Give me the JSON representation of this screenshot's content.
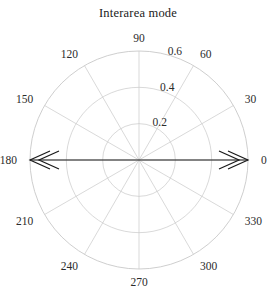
{
  "figure": {
    "title": "Interarea mode",
    "background_color": "#ffffff",
    "grid_color": "#c8c8c8",
    "axis_color": "#b4b4b4",
    "data_color": "#1a1a1a",
    "text_color": "#2b2b2b"
  },
  "chart_data": {
    "type": "scatter",
    "projection": "polar",
    "title": "Interarea mode",
    "xlabel": "",
    "ylabel": "",
    "angular_unit": "degrees",
    "angular_direction": "counterclockwise",
    "angular_zero_location": "E",
    "angle_ticks": [
      0,
      30,
      60,
      90,
      120,
      150,
      180,
      210,
      240,
      270,
      300,
      330
    ],
    "angle_tick_labels": [
      "0",
      "30",
      "60",
      "90",
      "120",
      "150",
      "180",
      "210",
      "240",
      "270",
      "300",
      "330"
    ],
    "radial_ticks": [
      0.2,
      0.4,
      0.6
    ],
    "radial_tick_labels": [
      "0.2",
      "0.4",
      "0.6"
    ],
    "rlim": [
      0,
      0.6
    ],
    "grid": true,
    "legend": false,
    "series": [
      {
        "name": "Interarea mode",
        "style": "double-headed-arrow",
        "points": [
          {
            "angle_deg": 0,
            "radius": 0.6
          },
          {
            "angle_deg": 180,
            "radius": 0.6
          }
        ]
      }
    ]
  }
}
